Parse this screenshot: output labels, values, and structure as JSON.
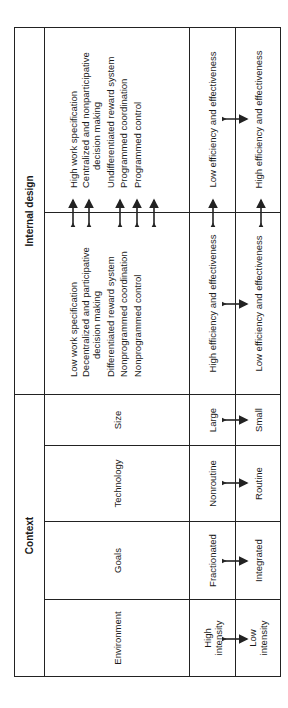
{
  "groups": {
    "context": "Context",
    "internal_design": "Internal design"
  },
  "context_columns": [
    {
      "name": "Environment",
      "row1": [
        "High",
        "intensity"
      ],
      "row2": [
        "Low",
        "intensity"
      ]
    },
    {
      "name": "Goals",
      "row1": [
        "Fractionated"
      ],
      "row2": [
        "Integrated"
      ]
    },
    {
      "name": "Technology",
      "row1": [
        "Nonroutine"
      ],
      "row2": [
        "Routine"
      ]
    },
    {
      "name": "Size",
      "row1": [
        "Large"
      ],
      "row2": [
        "Small"
      ]
    }
  ],
  "internal_design": {
    "left_list": [
      {
        "text": "Low work specification",
        "cont": false
      },
      {
        "text": "Decentralized and participative",
        "cont": false
      },
      {
        "text": "decision making",
        "cont": true
      },
      {
        "text": "Differentiated reward system",
        "cont": false
      },
      {
        "text": "Nonprogrammed coordination",
        "cont": false
      },
      {
        "text": "Nonprogrammed control",
        "cont": false
      }
    ],
    "right_list": [
      {
        "text": "High work specification",
        "cont": false
      },
      {
        "text": "Centralized and nonparticipative",
        "cont": false
      },
      {
        "text": "decision making",
        "cont": true
      },
      {
        "text": "Undifferentiated reward system",
        "cont": false
      },
      {
        "text": "Programmed coordination",
        "cont": false
      },
      {
        "text": "Programmed control",
        "cont": false
      }
    ],
    "row1_left": "High efficiency and effectiveness",
    "row1_right": "Low efficiency and effectiveness",
    "row2_left": "Low efficiency and effectiveness",
    "row2_right": "High efficiency and effectiveness"
  },
  "icons": {
    "arrow": "double-headed-arrow"
  },
  "colors": {
    "line": "#222222",
    "text": "#1a1a1a",
    "background": "#ffffff"
  }
}
